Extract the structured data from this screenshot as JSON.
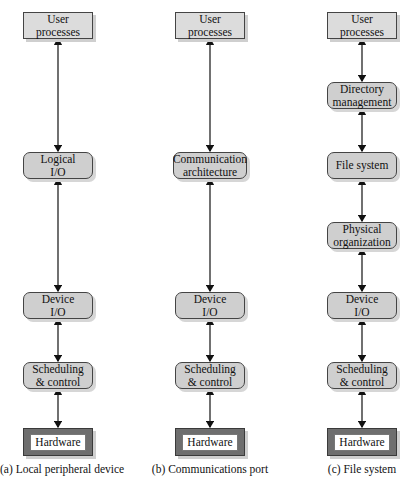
{
  "diagram": {
    "columns": [
      {
        "id": "a",
        "caption": "(a) Local peripheral device",
        "nodes": [
          {
            "label_line1": "User",
            "label_line2": "processes",
            "shape": "rect"
          },
          {
            "label_line1": "Logical",
            "label_line2": "I/O",
            "shape": "rounded"
          },
          {
            "label_line1": "Device",
            "label_line2": "I/O",
            "shape": "rounded"
          },
          {
            "label_line1": "Scheduling",
            "label_line2": "& control",
            "shape": "rounded"
          },
          {
            "label_line1": "Hardware",
            "label_line2": "",
            "shape": "hardware"
          }
        ]
      },
      {
        "id": "b",
        "caption": "(b) Communications port",
        "nodes": [
          {
            "label_line1": "User",
            "label_line2": "processes",
            "shape": "rect"
          },
          {
            "label_line1": "Communication",
            "label_line2": "architecture",
            "shape": "rounded"
          },
          {
            "label_line1": "Device",
            "label_line2": "I/O",
            "shape": "rounded"
          },
          {
            "label_line1": "Scheduling",
            "label_line2": "& control",
            "shape": "rounded"
          },
          {
            "label_line1": "Hardware",
            "label_line2": "",
            "shape": "hardware"
          }
        ]
      },
      {
        "id": "c",
        "caption": "(c) File system",
        "nodes": [
          {
            "label_line1": "User",
            "label_line2": "processes",
            "shape": "rect"
          },
          {
            "label_line1": "Directory",
            "label_line2": "management",
            "shape": "rounded"
          },
          {
            "label_line1": "File system",
            "label_line2": "",
            "shape": "rounded"
          },
          {
            "label_line1": "Physical",
            "label_line2": "organization",
            "shape": "rounded"
          },
          {
            "label_line1": "Device",
            "label_line2": "I/O",
            "shape": "rounded"
          },
          {
            "label_line1": "Scheduling",
            "label_line2": "& control",
            "shape": "rounded"
          },
          {
            "label_line1": "Hardware",
            "label_line2": "",
            "shape": "hardware"
          }
        ]
      }
    ],
    "edges": "bidirectional arrows between consecutive layers",
    "colors": {
      "rect_fill": "#dcdcdc",
      "rounded_fill": "#cfcfcf",
      "hardware_fill": "#6e6e6e",
      "line": "#111111"
    }
  }
}
